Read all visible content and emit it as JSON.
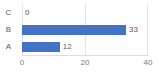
{
  "chart_data": {
    "type": "bar",
    "orientation": "horizontal",
    "title": "",
    "xlabel": "",
    "ylabel": "",
    "categories": [
      "C",
      "B",
      "A"
    ],
    "values": [
      0,
      33,
      12
    ],
    "data_labels": [
      "0",
      "33",
      "12"
    ],
    "xlim": [
      0,
      40
    ],
    "xticks": [
      0,
      20,
      40
    ],
    "xtick_labels": [
      "0",
      "20",
      "40"
    ],
    "grid": true,
    "grid_axis": "x",
    "legend": false,
    "legend_position": "none",
    "series": [
      {
        "name": "",
        "values": [
          0,
          33,
          12
        ]
      }
    ]
  },
  "style": {
    "bar_color": "#4472C4",
    "grid_color": "#E4E4E4",
    "axis_line_color": "#DDDDDD",
    "text_color": "#5A5A5A",
    "tick_text_color": "#7A7A7A",
    "background": "#FFFFFF"
  }
}
